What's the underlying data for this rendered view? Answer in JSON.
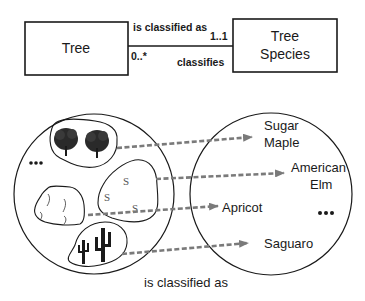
{
  "uml": {
    "left_class": {
      "label": "Tree"
    },
    "right_class": {
      "label_line1": "Tree",
      "label_line2": "Species"
    },
    "association": {
      "forward_label": "is classified as",
      "reverse_label": "classifies",
      "left_multiplicity": "0..*",
      "right_multiplicity": "1..1"
    }
  },
  "instance_diagram": {
    "left_set": {
      "groups": [
        {
          "kind": "deciduous-trees",
          "icon": "tree-icon"
        },
        {
          "kind": "stone-fruit-trees",
          "icon": "s-glyph",
          "glyphs": [
            "S",
            "S",
            "S"
          ]
        },
        {
          "kind": "rock-outline",
          "icon": "rock-icon"
        },
        {
          "kind": "cacti",
          "icon": "cactus-icon"
        }
      ],
      "ellipsis": "•••"
    },
    "right_set": {
      "species": [
        {
          "line1": "Sugar",
          "line2": "Maple"
        },
        {
          "line1": "American",
          "line2": "Elm"
        },
        {
          "line1": "Apricot"
        },
        {
          "line1": "Saguaro"
        }
      ],
      "ellipsis": "•••"
    },
    "caption": "is classified as"
  },
  "colors": {
    "stroke": "#1a1a1a",
    "arrow": "#7a7a7a",
    "background": "#ffffff"
  }
}
